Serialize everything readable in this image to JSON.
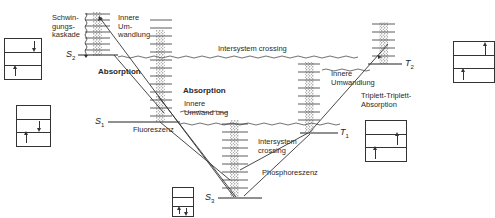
{
  "diagram": {
    "type": "jablonski-energy-level-diagram",
    "states": {
      "s2": {
        "letter": "S",
        "sub": "2"
      },
      "s1": {
        "letter": "S",
        "sub": "1"
      },
      "s0": {
        "letter": "S",
        "sub": "3"
      },
      "t2": {
        "letter": "T",
        "sub": "2"
      },
      "t1": {
        "letter": "T",
        "sub": "1"
      }
    },
    "labels": {
      "schwingungskaskade": "Schwin-\ngungs-\nkaskade",
      "innere_umwandlung_top": "Innere\nUm-\nwandlung",
      "intersystem_crossing_top": "Intersystem crossing",
      "absorption_main": "Absorption",
      "absorption_s1": "Absorption",
      "innere_umwandlung_s1": "Innere\nUmwand ung",
      "fluoreszenz": "Fluoreszenz",
      "innere_umwandlung_t2": "Innere\nUmwandlung",
      "triplett_absorption": "Triplett-Triplett-\nAbsorption",
      "intersystem_crossing_t1": "Intersystem\ncrossing",
      "phosphoreszenz": "Phosphoreszenz"
    },
    "colors": {
      "line": "#333333",
      "background": "#ffffff",
      "stipple": "#555555"
    }
  }
}
